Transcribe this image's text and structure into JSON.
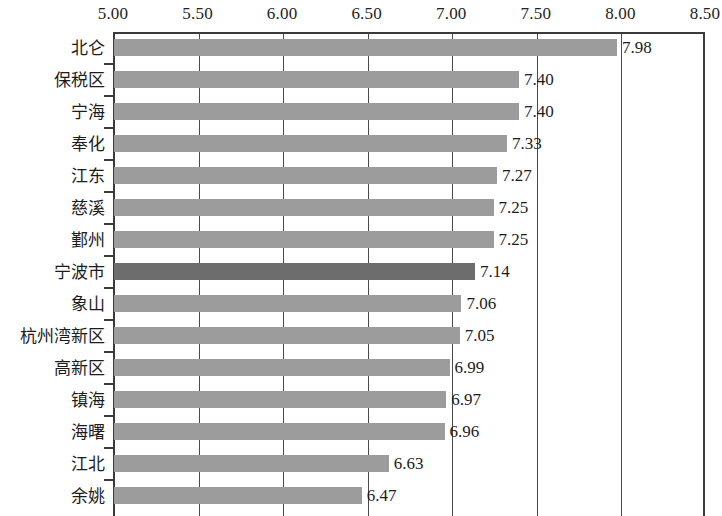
{
  "chart_data": {
    "type": "bar",
    "orientation": "horizontal",
    "title": "",
    "subtitle": "",
    "xlabel": "",
    "ylabel": "",
    "xlim": [
      5.0,
      8.5
    ],
    "xtick_step": 0.5,
    "xticks": [
      "5.00",
      "5.50",
      "6.00",
      "6.50",
      "7.00",
      "7.50",
      "8.00",
      "8.50"
    ],
    "xtick_values": [
      5.0,
      5.5,
      6.0,
      6.5,
      7.0,
      7.5,
      8.0,
      8.5
    ],
    "grid": true,
    "grid_axis": "x",
    "legend": false,
    "legend_position": "none",
    "value_labels": true,
    "categories": [
      "北仑",
      "保税区",
      "宁海",
      "奉化",
      "江东",
      "慈溪",
      "鄞州",
      "宁波市",
      "象山",
      "杭州湾新区",
      "高新区",
      "镇海",
      "海曙",
      "江北",
      "余姚"
    ],
    "values": [
      7.98,
      7.4,
      7.4,
      7.33,
      7.27,
      7.25,
      7.25,
      7.14,
      7.06,
      7.05,
      6.99,
      6.97,
      6.96,
      6.63,
      6.47
    ],
    "value_labels_text": [
      "7.98",
      "7.40",
      "7.40",
      "7.33",
      "7.27",
      "7.25",
      "7.25",
      "7.14",
      "7.06",
      "7.05",
      "6.99",
      "6.97",
      "6.96",
      "6.63",
      "6.47"
    ],
    "highlight_category": "宁波市",
    "highlight_index": 7,
    "colors": {
      "bar": "#9c9c9c",
      "bar_highlight": "#6d6d6d",
      "axis": "#3a3a3a",
      "gridline": "#4a4a4a",
      "text": "#1c1c1c",
      "background": "#ffffff"
    }
  }
}
